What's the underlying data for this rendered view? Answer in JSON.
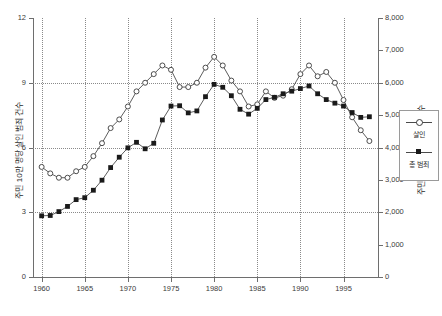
{
  "chart_data": {
    "type": "line",
    "title": "",
    "xlabel": "",
    "ylabel": "주민 10만 명당 살인 범죄 건수",
    "y2label": "주민 10만 명당 총 범죄 건수",
    "grid": true,
    "legend_position": "right",
    "xlim": [
      1959,
      1999
    ],
    "ylim": [
      0,
      12
    ],
    "y2lim": [
      0,
      8000
    ],
    "xticks": [
      1960,
      1965,
      1970,
      1975,
      1980,
      1985,
      1990,
      1995
    ],
    "xticklabels": [
      "1960",
      "1965",
      "1970",
      "1975",
      "1980",
      "1985",
      "1990",
      "1995"
    ],
    "yticks": [
      0,
      3,
      6,
      9,
      12
    ],
    "yticklabels": [
      "0",
      "3",
      "6",
      "9",
      "12"
    ],
    "y2ticks": [
      0,
      1000,
      2000,
      3000,
      4000,
      5000,
      6000,
      7000,
      8000
    ],
    "y2ticklabels": [
      "0",
      "1,000",
      "2,000",
      "3,000",
      "4,000",
      "5,000",
      "6,000",
      "7,000",
      "8,000"
    ],
    "x": [
      1960,
      1961,
      1962,
      1963,
      1964,
      1965,
      1966,
      1967,
      1968,
      1969,
      1970,
      1971,
      1972,
      1973,
      1974,
      1975,
      1976,
      1977,
      1978,
      1979,
      1980,
      1981,
      1982,
      1983,
      1984,
      1985,
      1986,
      1987,
      1988,
      1989,
      1990,
      1991,
      1992,
      1993,
      1994,
      1995,
      1996,
      1997,
      1998
    ],
    "series": [
      {
        "name": "살인",
        "axis": "left",
        "marker": "open-circle",
        "values": [
          5.1,
          4.8,
          4.6,
          4.6,
          4.9,
          5.1,
          5.6,
          6.2,
          6.9,
          7.3,
          7.9,
          8.6,
          9.0,
          9.4,
          9.8,
          9.6,
          8.8,
          8.8,
          9.0,
          9.7,
          10.2,
          9.8,
          9.1,
          8.6,
          7.9,
          8.0,
          8.6,
          8.3,
          8.4,
          8.7,
          9.4,
          9.8,
          9.3,
          9.5,
          9.0,
          8.2,
          7.4,
          6.8,
          6.3
        ]
      },
      {
        "name": "총 범죄",
        "axis": "right",
        "marker": "filled-square",
        "values": [
          1890,
          1900,
          2020,
          2180,
          2390,
          2450,
          2680,
          2990,
          3380,
          3700,
          3990,
          4160,
          3960,
          4130,
          4850,
          5280,
          5290,
          5070,
          5130,
          5570,
          5950,
          5860,
          5600,
          5180,
          5030,
          5210,
          5480,
          5550,
          5660,
          5740,
          5820,
          5900,
          5660,
          5480,
          5370,
          5280,
          5080,
          4930,
          4950
        ]
      }
    ]
  },
  "legend": {
    "items": [
      {
        "label": "살인",
        "marker": "open-circle"
      },
      {
        "label": "총 범죄",
        "marker": "filled-square"
      }
    ]
  },
  "colors": {
    "line": "#4a4a4a",
    "marker_fill": "#1a1a1a",
    "marker_open": "#ffffff",
    "grid": "#8a8a8a",
    "axis": "#6e6e6e",
    "background": "#ffffff"
  }
}
